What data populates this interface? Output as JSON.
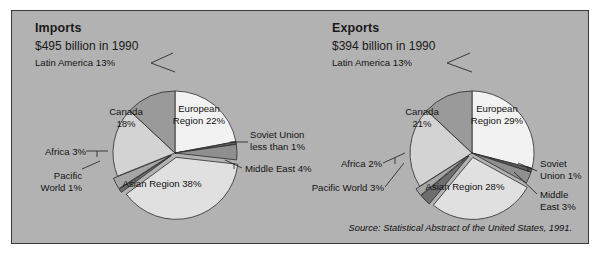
{
  "figure": {
    "background_color": "#b2b2b2",
    "border_color": "#3a3a3a",
    "source_note": "Source: Statistical Abstract of the United States, 1991."
  },
  "charts": [
    {
      "title": "Imports",
      "subtitle": "$495 billion in 1990",
      "labels": {
        "latin_america": "Latin America 13%",
        "canada_l1": "Canada",
        "canada_l2": "18%",
        "european_l1": "European",
        "european_l2": "Region 22%",
        "soviet_l1": "Soviet Union",
        "soviet_l2": "less than 1%",
        "middle_east": "Middle East 4%",
        "asian": "Asian Region 38%",
        "pacific_l1": "Pacific",
        "pacific_l2": "World 1%",
        "africa": "Africa 3%"
      }
    },
    {
      "title": "Exports",
      "subtitle": "$394 billion in 1990",
      "labels": {
        "latin_america": "Latin America 13%",
        "canada_l1": "Canada",
        "canada_l2": "21%",
        "european_l1": "European",
        "european_l2": "Region 29%",
        "soviet_l1": "Soviet",
        "soviet_l2": "Union 1%",
        "middle_east_l1": "Middle",
        "middle_east_l2": "East 3%",
        "asian": "Asian Region 28%",
        "pacific": "Pacific World 3%",
        "africa": "Africa 2%"
      }
    }
  ],
  "chart_data": [
    {
      "type": "pie",
      "title": "Imports",
      "subtitle": "$495 billion in 1990",
      "total_label": "$495 billion in 1990",
      "total_value": 495,
      "units": "billion USD",
      "year": 1990,
      "categories": [
        "European Region",
        "Soviet Union",
        "Middle East",
        "Asian Region",
        "Pacific World",
        "Africa",
        "Canada",
        "Latin America"
      ],
      "values": [
        22,
        0.7,
        4,
        38,
        1,
        3,
        18,
        13
      ],
      "value_labels": [
        "22%",
        "less than 1%",
        "4%",
        "38%",
        "1%",
        "3%",
        "18%",
        "13%"
      ],
      "colors": [
        "#f2f2f2",
        "#5c5c5c",
        "#8f8f8f",
        "#e0e0e0",
        "#6e6e6e",
        "#a6a6a6",
        "#d3d3d3",
        "#9a9a9a"
      ],
      "start_angle_deg": 0,
      "direction": "clockwise",
      "legend": "none",
      "labels_position": "outside-and-inside"
    },
    {
      "type": "pie",
      "title": "Exports",
      "subtitle": "$394 billion in 1990",
      "total_label": "$394 billion in 1990",
      "total_value": 394,
      "units": "billion USD",
      "year": 1990,
      "categories": [
        "European Region",
        "Soviet Union",
        "Middle East",
        "Asian Region",
        "Pacific World",
        "Africa",
        "Canada",
        "Latin America"
      ],
      "values": [
        29,
        1,
        3,
        28,
        3,
        2,
        21,
        13
      ],
      "value_labels": [
        "29%",
        "1%",
        "3%",
        "28%",
        "3%",
        "2%",
        "21%",
        "13%"
      ],
      "colors": [
        "#f2f2f2",
        "#5c5c5c",
        "#8f8f8f",
        "#e0e0e0",
        "#6e6e6e",
        "#a6a6a6",
        "#d3d3d3",
        "#9a9a9a"
      ],
      "start_angle_deg": 0,
      "direction": "clockwise",
      "legend": "none",
      "labels_position": "outside-and-inside"
    }
  ]
}
